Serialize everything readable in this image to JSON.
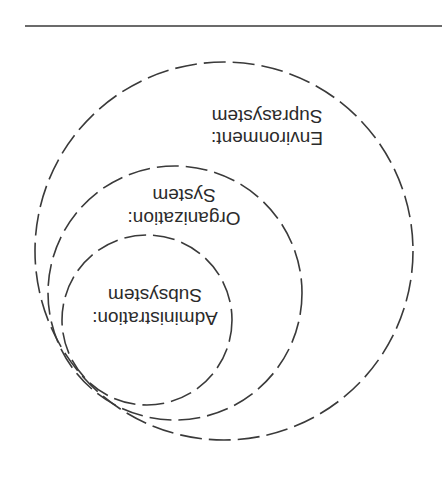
{
  "diagram": {
    "type": "nested-systems",
    "orientation_rotated_degrees": 180,
    "rings": [
      {
        "id": "environment",
        "line1": "Environment:",
        "line2": "Suprasystem",
        "cx": 224,
        "cy": 251,
        "r": 189
      },
      {
        "id": "organization",
        "line1": "Organization:",
        "line2": "System",
        "cx": 175,
        "cy": 293,
        "r": 127
      },
      {
        "id": "administration",
        "line1": "Administration:",
        "line2": "Subsystem",
        "cx": 147,
        "cy": 320,
        "r": 85
      }
    ],
    "colors": {
      "stroke": "#3a3a3a",
      "text": "#2b2b2b",
      "background": "#ffffff"
    }
  }
}
